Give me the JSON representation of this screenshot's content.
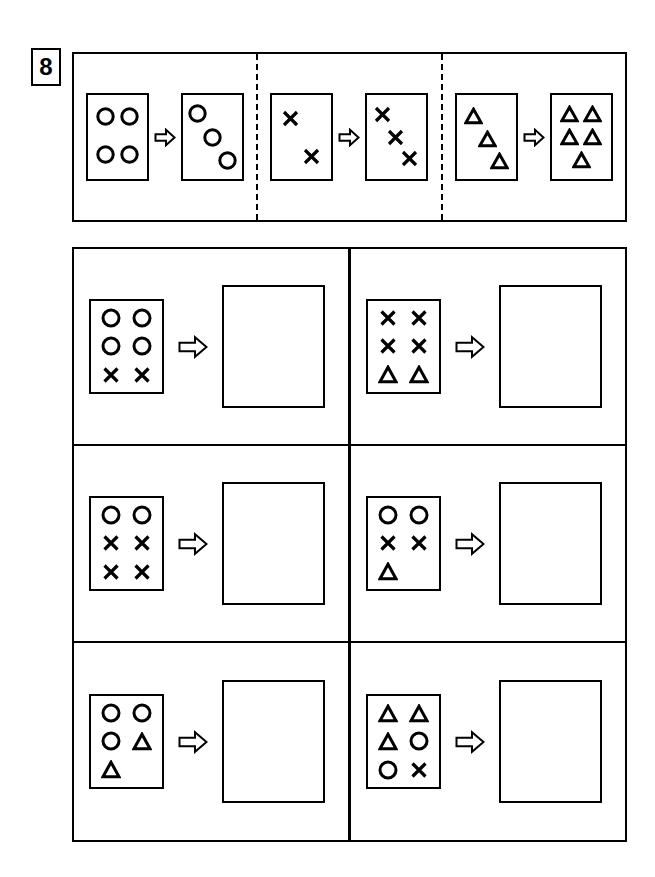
{
  "exercise": {
    "number": "8",
    "arrow_icon": "right-arrow-icon"
  },
  "examples": [
    {
      "id": "example-1",
      "input": {
        "layout": "freeform",
        "shapes": [
          "circle",
          "circle",
          "circle",
          "circle"
        ],
        "description": "four circles in a 2 by 2 arrangement",
        "count": 4
      },
      "output": {
        "layout": "diagonal",
        "shapes": [
          "circle",
          "circle",
          "circle"
        ],
        "description": "three circles in a descending diagonal",
        "count": 3
      }
    },
    {
      "id": "example-2",
      "input": {
        "layout": "diagonal",
        "shapes": [
          "cross",
          "cross"
        ],
        "description": "two crosses in a descending diagonal",
        "count": 2
      },
      "output": {
        "layout": "diagonal",
        "shapes": [
          "cross",
          "cross",
          "cross"
        ],
        "description": "three crosses in a descending diagonal",
        "count": 3
      }
    },
    {
      "id": "example-3",
      "input": {
        "layout": "diagonal",
        "shapes": [
          "triangle",
          "triangle",
          "triangle"
        ],
        "description": "three triangles in a descending diagonal",
        "count": 3
      },
      "output": {
        "layout": "grid",
        "shapes": [
          "triangle",
          "triangle",
          "triangle",
          "triangle",
          "triangle"
        ],
        "description": "five triangles arranged two, two and one",
        "count": 5
      }
    }
  ],
  "questions": [
    {
      "id": "question-1",
      "position": "row1-left",
      "input": {
        "rows": [
          [
            "circle",
            "circle"
          ],
          [
            "circle",
            "circle"
          ],
          [
            "cross",
            "cross"
          ]
        ],
        "counts": {
          "circle": 4,
          "cross": 2,
          "triangle": 0
        }
      },
      "answer": {
        "filled": false,
        "value": ""
      }
    },
    {
      "id": "question-2",
      "position": "row1-right",
      "input": {
        "rows": [
          [
            "cross",
            "cross"
          ],
          [
            "cross",
            "cross"
          ],
          [
            "triangle",
            "triangle"
          ]
        ],
        "counts": {
          "circle": 0,
          "cross": 4,
          "triangle": 2
        }
      },
      "answer": {
        "filled": false,
        "value": ""
      }
    },
    {
      "id": "question-3",
      "position": "row2-left",
      "input": {
        "rows": [
          [
            "circle",
            "circle"
          ],
          [
            "cross",
            "cross"
          ],
          [
            "cross",
            "cross"
          ]
        ],
        "counts": {
          "circle": 2,
          "cross": 4,
          "triangle": 0
        }
      },
      "answer": {
        "filled": false,
        "value": ""
      }
    },
    {
      "id": "question-4",
      "position": "row2-right",
      "input": {
        "rows": [
          [
            "circle",
            "circle"
          ],
          [
            "cross",
            "cross"
          ],
          [
            "triangle",
            null
          ]
        ],
        "counts": {
          "circle": 2,
          "cross": 2,
          "triangle": 1
        }
      },
      "answer": {
        "filled": false,
        "value": ""
      }
    },
    {
      "id": "question-5",
      "position": "row3-left",
      "input": {
        "rows": [
          [
            "circle",
            "circle"
          ],
          [
            "circle",
            "triangle"
          ],
          [
            "triangle",
            null
          ]
        ],
        "counts": {
          "circle": 3,
          "cross": 0,
          "triangle": 2
        }
      },
      "answer": {
        "filled": false,
        "value": ""
      }
    },
    {
      "id": "question-6",
      "position": "row3-right",
      "input": {
        "rows": [
          [
            "triangle",
            "triangle"
          ],
          [
            "triangle",
            "circle"
          ],
          [
            "circle",
            "cross"
          ]
        ],
        "counts": {
          "circle": 2,
          "cross": 1,
          "triangle": 3
        }
      },
      "answer": {
        "filled": false,
        "value": ""
      }
    }
  ],
  "colors": {
    "ink": "#000000",
    "paper": "#ffffff"
  }
}
